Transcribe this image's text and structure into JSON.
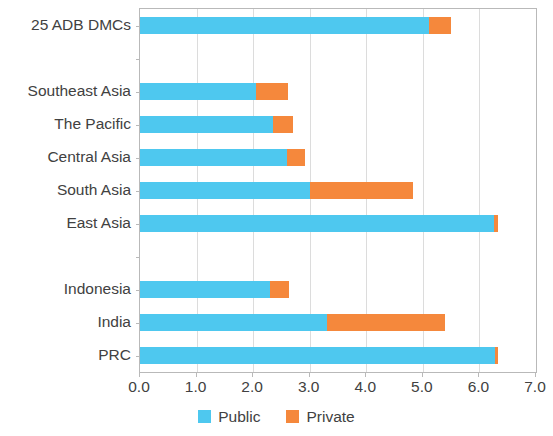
{
  "chart_data": {
    "type": "bar",
    "orientation": "horizontal",
    "stacked": true,
    "title": "",
    "subtitle": "",
    "xlabel": "",
    "ylabel": "",
    "xlim": [
      0.0,
      7.0
    ],
    "xticks": [
      "0.0",
      "1.0",
      "2.0",
      "3.0",
      "4.0",
      "5.0",
      "6.0",
      "7.0"
    ],
    "xtick_values": [
      0.0,
      1.0,
      2.0,
      3.0,
      4.0,
      5.0,
      6.0,
      7.0
    ],
    "grid": true,
    "grid_axis": "x",
    "legend_position": "bottom",
    "categories": [
      "25 ADB DMCs",
      "",
      "Southeast Asia",
      "The Pacific",
      "Central Asia",
      "South Asia",
      "East Asia",
      "",
      "Indonesia",
      "India",
      "PRC"
    ],
    "series": [
      {
        "name": "Public",
        "color": "#4ec8ef",
        "values": [
          5.1,
          null,
          2.05,
          2.35,
          2.6,
          3.0,
          6.25,
          null,
          2.3,
          3.3,
          6.27
        ]
      },
      {
        "name": "Private",
        "color": "#f5883c",
        "values": [
          0.4,
          null,
          0.57,
          0.35,
          0.32,
          1.82,
          0.08,
          null,
          0.33,
          2.09,
          0.06
        ]
      }
    ],
    "totals": [
      5.5,
      null,
      2.62,
      2.7,
      2.92,
      4.82,
      6.33,
      null,
      2.63,
      5.39,
      6.33
    ]
  },
  "legend": {
    "items": [
      {
        "label": "Public",
        "color": "#4ec8ef"
      },
      {
        "label": "Private",
        "color": "#f5883c"
      }
    ]
  },
  "axis": {
    "x_tick_labels": [
      "0.0",
      "1.0",
      "2.0",
      "3.0",
      "4.0",
      "5.0",
      "6.0",
      "7.0"
    ],
    "y_tick_labels": [
      "25 ADB DMCs",
      "",
      "Southeast Asia",
      "The Pacific",
      "Central Asia",
      "South Asia",
      "East Asia",
      "",
      "Indonesia",
      "India",
      "PRC"
    ]
  },
  "colors": {
    "public": "#4ec8ef",
    "private": "#f5883c",
    "frame": "#b9b9b9",
    "grid": "#dcdcdc",
    "text": "#414141"
  }
}
